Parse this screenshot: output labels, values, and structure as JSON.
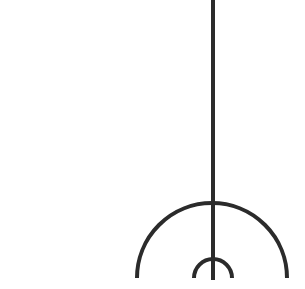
{
  "diagram": {
    "stroke_color": "#2b2b2b",
    "background_color": "#ffffff",
    "stroke_width": 4,
    "stem": {
      "x": 213,
      "y1": 0,
      "y2": 280
    },
    "large_arc": {
      "cx": 212,
      "cy": 278,
      "r": 75
    },
    "small_arc": {
      "cx": 213,
      "cy": 278,
      "r": 19
    }
  }
}
